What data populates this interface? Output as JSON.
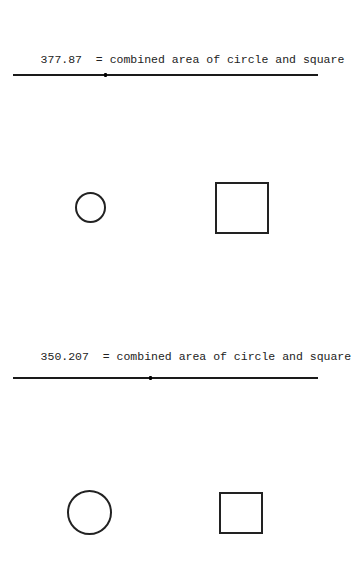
{
  "panels": [
    {
      "value": "377.87",
      "description": "= combined area of circle and square",
      "slider_position_px": 92,
      "circle": {
        "cx": 90,
        "cy": 207,
        "r": 15
      },
      "square": {
        "x": 215,
        "y": 182,
        "w": 54,
        "h": 51
      }
    },
    {
      "value": "350.207",
      "description": "= combined area of circle and square",
      "slider_position_px": 137,
      "circle": {
        "cx": 89,
        "cy": 512,
        "r": 22
      },
      "square": {
        "x": 219,
        "y": 492,
        "w": 43,
        "h": 41
      }
    }
  ]
}
